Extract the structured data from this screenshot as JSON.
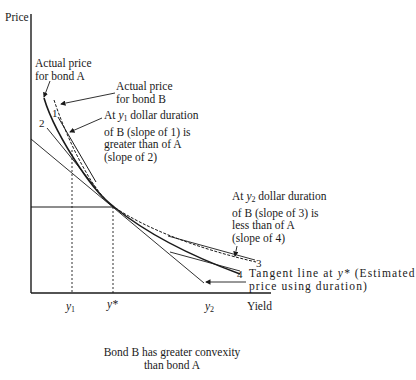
{
  "axes": {
    "y_label": "Price",
    "x_label": "Yield",
    "x_ticks": [
      "y1",
      "y*",
      "y2"
    ]
  },
  "labels": {
    "bond_a": [
      "Actual price",
      "for bond A"
    ],
    "bond_b": [
      "Actual price",
      "for bond B"
    ],
    "y1_note": [
      "At y1 dollar duration",
      "of B (slope of 1) is",
      "greater than of A",
      "(slope of 2)"
    ],
    "y1_note_parts": {
      "prefix": "At ",
      "var": "y",
      "sub": "1",
      "suffix": " dollar duration"
    },
    "y2_note": [
      "At y2 dollar duration",
      "of B (slope of 3) is",
      "less than of A",
      "(slope of 4)"
    ],
    "y2_note_parts": {
      "prefix": "At ",
      "var": "y",
      "sub": "2",
      "suffix": " dollar duration"
    },
    "tangent": [
      "Tangent line at y* (Estimated",
      "price using duration)"
    ],
    "tangent_parts": {
      "prefix": "Tangent line at ",
      "var": "y*",
      "suffix": " (Estimated"
    },
    "slope_markers": [
      "1",
      "2",
      "3",
      "4"
    ]
  },
  "tick_labels": {
    "y1_var": "y",
    "y1_sub": "1",
    "ystar": "y*",
    "y2_var": "y",
    "y2_sub": "2"
  },
  "caption": [
    "Bond B has greater convexity",
    "than bond A"
  ],
  "colors": {
    "ink": "#1a1a1a",
    "background": "#ffffff"
  }
}
